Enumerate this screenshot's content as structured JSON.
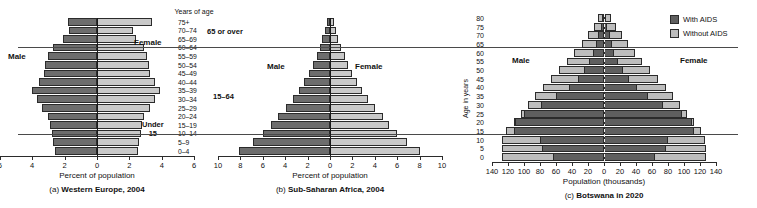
{
  "figure": {
    "age_groups": [
      "0–4",
      "5–9",
      "10–14",
      "15–19",
      "20–24",
      "25–29",
      "30–34",
      "35–39",
      "40–44",
      "45–49",
      "50–54",
      "55–59",
      "60–64",
      "65–69",
      "70–74",
      "75+"
    ],
    "age_column_header": "Years of age",
    "group_labels": {
      "over65": "65 or over",
      "middle": "15–64",
      "under15": "Under\n15",
      "under15_line1": "Under",
      "under15_line2": "15"
    },
    "sex": {
      "male": "Male",
      "female": "Female"
    }
  },
  "chart_data": [
    {
      "id": "western-europe",
      "type": "bar",
      "subtype": "population-pyramid",
      "title": "(a) Western Europe, 2004",
      "caption_prefix": "(a)",
      "caption_bold": "Western Europe, 2004",
      "xlabel": "Percent of population",
      "ylabel": "Years of age",
      "xlim": [
        6,
        6
      ],
      "xticks": [
        6,
        4,
        2,
        0,
        2,
        4,
        6
      ],
      "categories": [
        "0–4",
        "5–9",
        "10–14",
        "15–19",
        "20–24",
        "25–29",
        "30–34",
        "35–39",
        "40–44",
        "45–49",
        "50–54",
        "55–59",
        "60–64",
        "65–69",
        "70–74",
        "75+"
      ],
      "series": [
        {
          "name": "Male",
          "color": "#6d6d6d",
          "values": [
            2.6,
            2.7,
            2.8,
            2.9,
            3.0,
            3.4,
            3.7,
            4.0,
            3.6,
            3.3,
            3.2,
            3.0,
            2.7,
            2.1,
            1.7,
            1.8
          ]
        },
        {
          "name": "Female",
          "color": "#c9c9c9",
          "values": [
            2.5,
            2.6,
            2.7,
            2.8,
            2.9,
            3.3,
            3.6,
            3.9,
            3.6,
            3.3,
            3.2,
            3.1,
            2.9,
            2.4,
            2.2,
            3.4
          ]
        }
      ],
      "legend_position": "none",
      "grid": false
    },
    {
      "id": "sub-saharan-africa",
      "type": "bar",
      "subtype": "population-pyramid",
      "title": "(b) Sub-Saharan Africa, 2004",
      "caption_prefix": "(b)",
      "caption_bold": "Sub-Saharan Africa, 2004",
      "xlabel": "Percent of population",
      "ylabel": "Years of age",
      "xlim": [
        10,
        10
      ],
      "xticks": [
        10,
        8,
        6,
        4,
        2,
        0,
        2,
        4,
        6,
        8,
        10
      ],
      "categories": [
        "0–4",
        "5–9",
        "10–14",
        "15–19",
        "20–24",
        "25–29",
        "30–34",
        "35–39",
        "40–44",
        "45–49",
        "50–54",
        "55–59",
        "60–64",
        "65–69",
        "70–74",
        "75+"
      ],
      "series": [
        {
          "name": "Male",
          "color": "#6d6d6d",
          "values": [
            8.1,
            6.9,
            6.0,
            5.3,
            4.6,
            3.9,
            3.3,
            2.8,
            2.3,
            1.9,
            1.5,
            1.2,
            0.9,
            0.7,
            0.45,
            0.3
          ]
        },
        {
          "name": "Female",
          "color": "#c9c9c9",
          "values": [
            8.0,
            6.9,
            6.0,
            5.3,
            4.7,
            4.0,
            3.4,
            2.9,
            2.4,
            2.0,
            1.6,
            1.3,
            1.0,
            0.75,
            0.5,
            0.35
          ]
        }
      ],
      "legend_position": "none",
      "grid": false
    },
    {
      "id": "botswana-2020",
      "type": "bar",
      "subtype": "population-pyramid",
      "title": "(c) Botswana in 2020",
      "caption_prefix": "(c)",
      "caption_bold": "Botswana in 2020",
      "xlabel": "Population (thousands)",
      "ylabel": "Age in years",
      "xlim": [
        140,
        140
      ],
      "xticks": [
        140,
        120,
        100,
        80,
        60,
        40,
        20,
        0,
        20,
        40,
        60,
        80,
        100,
        120,
        140
      ],
      "yticks": [
        0,
        5,
        10,
        15,
        20,
        25,
        30,
        35,
        40,
        45,
        50,
        55,
        60,
        65,
        70,
        75,
        80
      ],
      "categories": [
        "0",
        "5",
        "10",
        "15",
        "20",
        "25",
        "30",
        "35",
        "40",
        "45",
        "50",
        "55",
        "60",
        "65",
        "70",
        "75",
        "80"
      ],
      "legend": [
        {
          "label": "With AIDS",
          "color": "#5f5f5f"
        },
        {
          "label": "Without AIDS",
          "color": "#bdbdbd"
        }
      ],
      "legend_position": "top-right",
      "series": [
        {
          "name": "Male Without AIDS",
          "color": "#bdbdbd",
          "values": [
            128,
            128,
            127,
            122,
            113,
            104,
            95,
            86,
            76,
            66,
            56,
            46,
            37,
            28,
            20,
            13,
            7
          ]
        },
        {
          "name": "Male With AIDS",
          "color": "#5f5f5f",
          "values": [
            64,
            78,
            80,
            112,
            111,
            100,
            79,
            60,
            44,
            33,
            25,
            19,
            14,
            10,
            7,
            4,
            2
          ]
        },
        {
          "name": "Female Without AIDS",
          "color": "#bdbdbd",
          "values": [
            127,
            127,
            126,
            121,
            113,
            104,
            95,
            86,
            77,
            67,
            57,
            48,
            39,
            30,
            22,
            15,
            9
          ]
        },
        {
          "name": "Female With AIDS",
          "color": "#5f5f5f",
          "values": [
            64,
            78,
            80,
            112,
            110,
            97,
            74,
            55,
            41,
            31,
            24,
            18,
            13,
            10,
            7,
            4,
            2
          ]
        }
      ],
      "grid": false
    }
  ]
}
